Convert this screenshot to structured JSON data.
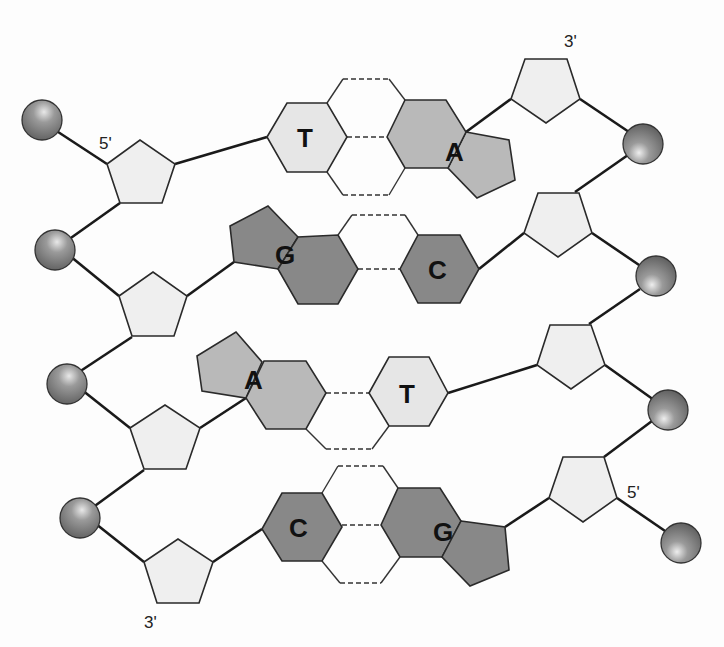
{
  "diagram": {
    "colors": {
      "background": "#fdfdfd",
      "sugar_fill": "#efefef",
      "pyrimidine_T_fill": "#e6e6e6",
      "purine_A_fill": "#b9b9b9",
      "G_C_fill": "#888888",
      "phosphate_fill": "#7a7a7a",
      "line": "#1a1a1a"
    },
    "strand_ends": {
      "left_top": "5'",
      "right_top": "3'",
      "left_bottom": "3'",
      "right_bottom": "5'"
    },
    "base_pairs": [
      {
        "left": "T",
        "right": "A",
        "bond": "hydrogen-bond-dashed"
      },
      {
        "left": "G",
        "right": "C",
        "bond": "hydrogen-bond-dashed"
      },
      {
        "left": "A",
        "right": "T",
        "bond": "hydrogen-bond-dashed"
      },
      {
        "left": "C",
        "right": "G",
        "bond": "hydrogen-bond-dashed"
      }
    ],
    "legend_components": [
      "phosphate (sphere)",
      "deoxyribose sugar (pentagon)",
      "nitrogenous base (hexagon / fused rings)"
    ]
  }
}
